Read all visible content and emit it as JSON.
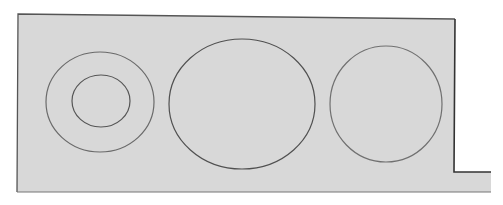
{
  "diagram": {
    "background": "#ffffff",
    "panel": {
      "fill": "#d8d8d8",
      "stroke": "#555555",
      "points": "18,14 455,19 454,172 491,172 491,192 17,192"
    },
    "shapes": [
      {
        "id": "left-outer-circle",
        "cx": 100,
        "cy": 102,
        "rx": 54,
        "ry": 50,
        "stroke": "#6a6a6a"
      },
      {
        "id": "left-inner-circle",
        "cx": 101,
        "cy": 101,
        "rx": 29,
        "ry": 26,
        "stroke": "#555555"
      },
      {
        "id": "middle-ellipse",
        "cx": 242,
        "cy": 104,
        "rx": 73,
        "ry": 65,
        "stroke": "#505050"
      },
      {
        "id": "right-circle",
        "cx": 386,
        "cy": 104,
        "rx": 56,
        "ry": 58,
        "stroke": "#707070"
      }
    ]
  }
}
